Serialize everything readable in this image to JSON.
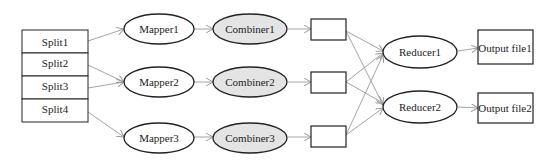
{
  "diagram": {
    "splits": [
      "Split1",
      "Split2",
      "Split3",
      "Split4"
    ],
    "mappers": [
      "Mapper1",
      "Mapper2",
      "Mapper3"
    ],
    "combiners": [
      "Combiner1",
      "Combiner2",
      "Combiner3"
    ],
    "reducers": [
      "Reducer1",
      "Reducer2"
    ],
    "outputs": [
      "Output file1",
      "Output file2"
    ],
    "colors": {
      "stroke": "#222222",
      "arrow": "#9a9a9a",
      "combiner_fill": "#e4e4e4"
    }
  }
}
